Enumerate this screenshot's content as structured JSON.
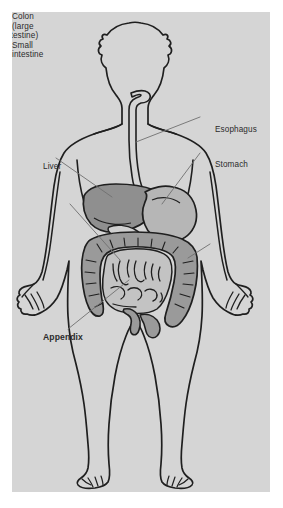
{
  "figure": {
    "panel_background": "#d5d5d5",
    "page_background": "#ffffff",
    "outline_color": "#1f1f1f",
    "leader_color": "#6f6f6f",
    "text_color": "#2b2b2b"
  },
  "labels": {
    "esophagus": "Esophagus",
    "stomach": "Stomach",
    "colon_line1": "Colon",
    "colon_line2": "(large",
    "colon_line3": "intestine)",
    "liver": "Liver",
    "small_line1": "Small",
    "small_line2": "intestine",
    "appendix": "Appendix"
  },
  "organs": {
    "liver": {
      "name": "Liver",
      "fill": "#8f8f8f"
    },
    "stomach": {
      "name": "Stomach",
      "fill": "#b6b6b6"
    },
    "colon": {
      "name": "Colon (large intestine)",
      "fill": "#9a9a9a"
    },
    "small_intestine": {
      "name": "Small intestine",
      "fill": "#c3c3c3"
    },
    "esophagus": {
      "name": "Esophagus",
      "fill": "#d5d5d5"
    },
    "appendix": {
      "name": "Appendix",
      "fill": "#9a9a9a"
    },
    "body": {
      "name": "Body silhouette",
      "fill": "#d5d5d5"
    }
  }
}
